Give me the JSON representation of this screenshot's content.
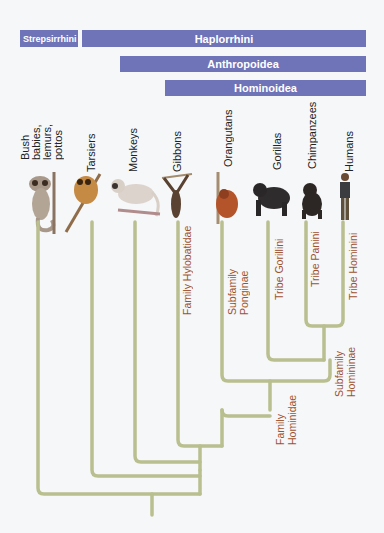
{
  "bars": {
    "strepsirrhini": "Strepsirrhini",
    "haplorrhini": "Haplorrhini",
    "anthropoidea": "Anthropoidea",
    "hominoidea": "Hominoidea"
  },
  "species": [
    {
      "label": "Bush babies,\nlemurs,\npottos",
      "icon": "bush-baby-icon"
    },
    {
      "label": "Tarsiers",
      "icon": "tarsier-icon"
    },
    {
      "label": "Monkeys",
      "icon": "monkey-icon"
    },
    {
      "label": "Gibbons",
      "icon": "gibbon-icon"
    },
    {
      "label": "Orangutans",
      "icon": "orangutan-icon"
    },
    {
      "label": "Gorillas",
      "icon": "gorilla-icon"
    },
    {
      "label": "Chimpanzees",
      "icon": "chimpanzee-icon"
    },
    {
      "label": "Humans",
      "icon": "human-icon"
    }
  ],
  "taxa": {
    "hylobatidae": "Family Hylobatidae",
    "ponginae": "Subfamily Ponginae",
    "gorillini": "Tribe Gorillini",
    "panini": "Tribe Panini",
    "hominini": "Tribe Hominini",
    "homininae": "Subfamily\nHomininae",
    "hominidae": "Family\nHominidae"
  },
  "colors": {
    "bar": "#6f73b8",
    "branch": "#b9bf8e",
    "taxon_label": "#a0522d",
    "background": "#f6f7f9"
  }
}
